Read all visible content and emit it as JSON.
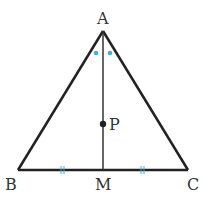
{
  "diagram": {
    "type": "geometry",
    "shape": "isosceles triangle with median",
    "points": {
      "A": {
        "label": "A",
        "x": 103,
        "y": 31
      },
      "B": {
        "label": "B",
        "x": 18,
        "y": 170
      },
      "C": {
        "label": "C",
        "x": 188,
        "y": 170
      },
      "M": {
        "label": "M",
        "x": 103,
        "y": 170
      },
      "P": {
        "label": "P",
        "x": 103,
        "y": 124
      }
    },
    "segments": [
      "AB",
      "AC",
      "BC",
      "AM"
    ],
    "markings": {
      "equal_segments": [
        "BM",
        "MC"
      ],
      "equal_angles": [
        "BAM",
        "MAC"
      ],
      "mark_color": "#3cb4d8"
    },
    "line_color": "#222222"
  }
}
